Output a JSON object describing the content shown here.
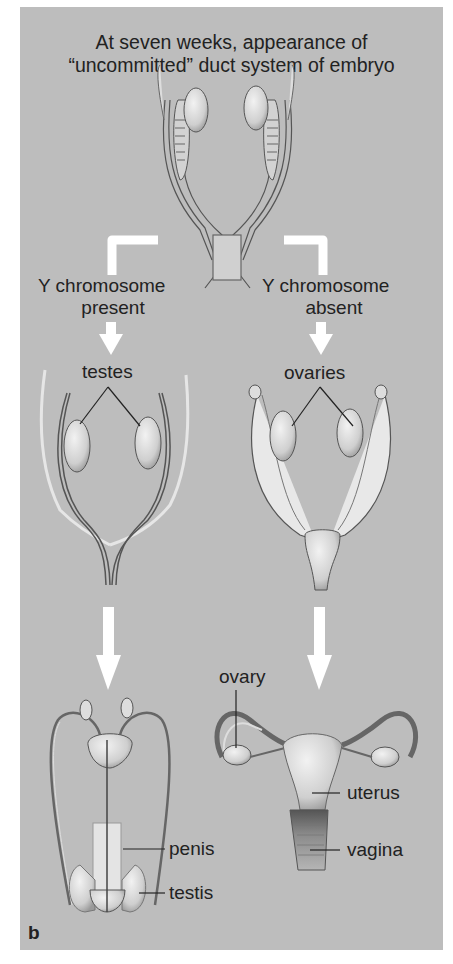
{
  "figure": {
    "panel_label": "b",
    "title_line1": "At seven weeks, appearance of",
    "title_line2": "“uncommitted” duct system of embryo",
    "branches": {
      "left": {
        "condition_line1": "Y chromosome",
        "condition_line2": "present",
        "stage1_label": "testes",
        "adult_labels": [
          "penis",
          "testis"
        ]
      },
      "right": {
        "condition_line1": "Y chromosome",
        "condition_line2": "absent",
        "stage1_label": "ovaries",
        "adult_labels": [
          "ovary",
          "uterus",
          "vagina"
        ]
      }
    },
    "colors": {
      "background": "#bdbdbd",
      "arrow": "#ffffff",
      "text": "#222222",
      "organ_fill": "#d9d9d9",
      "line": "#444444"
    }
  }
}
